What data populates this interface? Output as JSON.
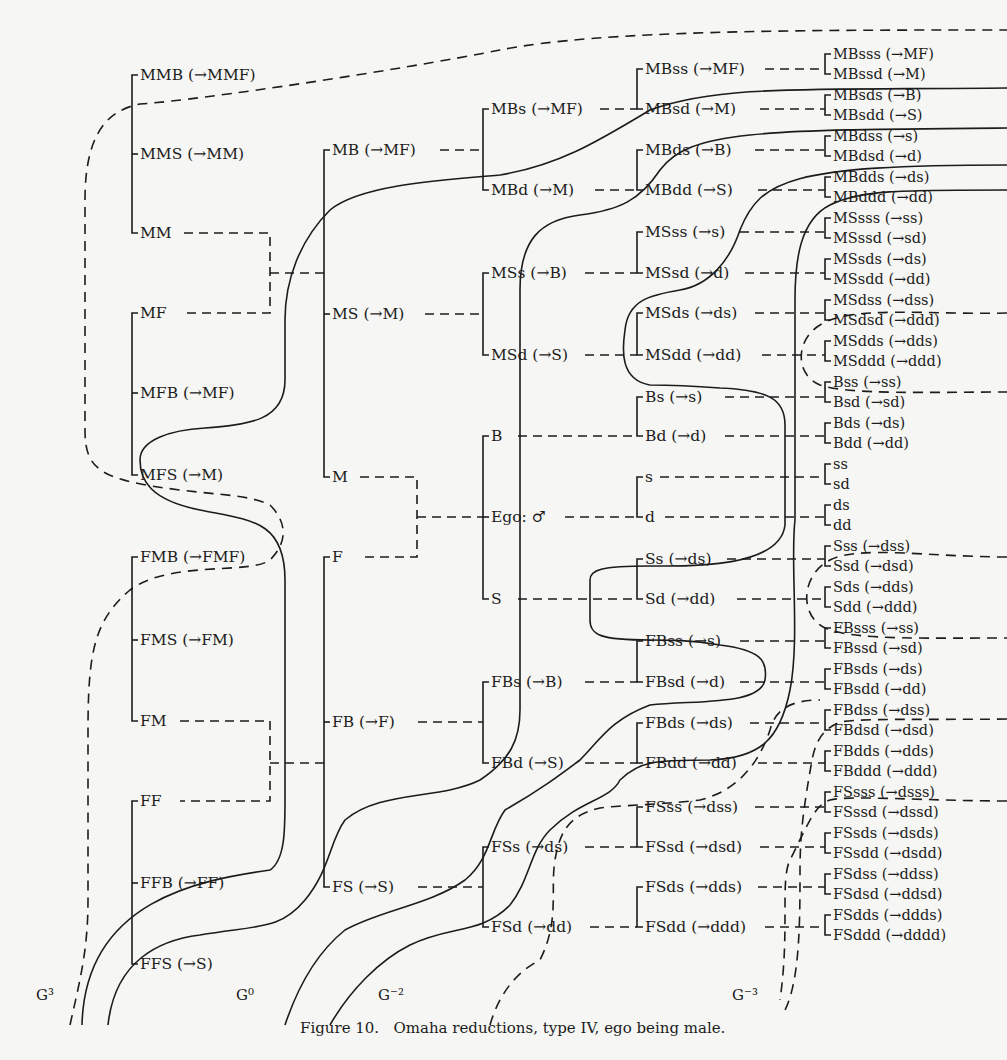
{
  "caption": "Figure 10.   Omaha reductions, type IV, ego being male.",
  "generations": {
    "g3": "G³",
    "g0": "G⁰",
    "gm2": "G⁻²",
    "gm3": "G⁻³"
  },
  "col_a": [
    "MMB (→MMF)",
    "MMS (→MM)",
    "MM",
    "MF",
    "MFB (→MF)",
    "MFS (→M)",
    "FMB (→FMF)",
    "FMS (→FM)",
    "FM",
    "FF",
    "FFB (→FF)",
    "FFS (→S)"
  ],
  "col_b": [
    "MB (→MF)",
    "MS (→M)",
    "M",
    "F",
    "FB (→F)",
    "FS (→S)"
  ],
  "col_c": [
    "MBs (→MF)",
    "MBd (→M)",
    "MSs (→B)",
    "MSd (→S)",
    "B",
    "Ego: ♂",
    "S",
    "FBs (→B)",
    "FBd (→S)",
    "FSs (→ds)",
    "FSd (→dd)"
  ],
  "col_d": [
    "MBss (→MF)",
    "MBsd (→M)",
    "MBds (→B)",
    "MBdd (→S)",
    "MSss (→s)",
    "MSsd (→d)",
    "MSds (→ds)",
    "MSdd (→dd)",
    "Bs (→s)",
    "Bd (→d)",
    "s",
    "d",
    "Ss (→ds)",
    "Sd (→dd)",
    "FBss (→s)",
    "FBsd (→d)",
    "FBds (→ds)",
    "FBdd (→dd)",
    "FSss (→dss)",
    "FSsd (→dsd)",
    "FSds (→dds)",
    "FSdd (→ddd)"
  ],
  "col_e": [
    "MBsss (→MF)",
    "MBssd (→M)",
    "MBsds (→B)",
    "MBsdd (→S)",
    "MBdss (→s)",
    "MBdsd (→d)",
    "MBdds (→ds)",
    "MBddd (→dd)",
    "MSsss (→ss)",
    "MSssd (→sd)",
    "MSsds (→ds)",
    "MSsdd (→dd)",
    "MSdss (→dss)",
    "MSdsd (→ddd)",
    "MSdds (→dds)",
    "MSddd (→ddd)",
    "Bss (→ss)",
    "Bsd (→sd)",
    "Bds (→ds)",
    "Bdd (→dd)",
    "ss",
    "sd",
    "ds",
    "dd",
    "Sss (→dss)",
    "Ssd (→dsd)",
    "Sds (→dds)",
    "Sdd (→ddd)",
    "FBsss (→ss)",
    "FBssd (→sd)",
    "FBsds (→ds)",
    "FBsdd (→dd)",
    "FBdss (→dss)",
    "FBdsd (→dsd)",
    "FBdds (→dds)",
    "FBddd (→ddd)",
    "FSsss (→dsss)",
    "FSssd (→dssd)",
    "FSsds (→dsds)",
    "FSsdd (→dsdd)",
    "FSdss (→ddss)",
    "FSdsd (→ddsd)",
    "FSdds (→ddds)",
    "FSddd (→dddd)"
  ]
}
